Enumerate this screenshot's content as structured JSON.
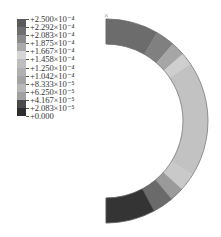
{
  "chart_data": {
    "type": "heatmap",
    "title": "",
    "legend": {
      "position": "top-left",
      "levels": [
        "+2.500×10⁻⁴",
        "+2.292×10⁻⁴",
        "+2.083×10⁻⁴",
        "+1.875×10⁻⁴",
        "+1.667×10⁻⁴",
        "+1.458×10⁻⁴",
        "+1.250×10⁻⁴",
        "+1.042×10⁻⁴",
        "+8.333×10⁻⁵",
        "+6.250×10⁻⁵",
        "+4.167×10⁻⁵",
        "+2.083×10⁻⁵",
        "+0.000"
      ],
      "values": [
        0.00025,
        0.0002292,
        0.0002083,
        0.0001875,
        0.0001667,
        0.0001458,
        0.000125,
        0.0001042,
        8.333e-05,
        6.25e-05,
        4.167e-05,
        2.083e-05,
        0.0
      ],
      "band_colors": [
        "#5a5a5a",
        "#6e6e6e",
        "#8a8a8a",
        "#a9a9a9",
        "#d6d6d6",
        "#bdbdbd",
        "#b0b0b0",
        "#a4a4a4",
        "#b8b8b8",
        "#a0a0a0",
        "#4a4a4a",
        "#2e2e2e"
      ]
    },
    "ring": {
      "center": [
        106,
        121
      ],
      "outer_radius": 102,
      "inner_radius": 77,
      "start_angle_deg": -90,
      "end_angle_deg": 90,
      "bands": [
        {
          "from": -90,
          "to": -60,
          "color": "#6c6c6c"
        },
        {
          "from": -60,
          "to": -49,
          "color": "#808080"
        },
        {
          "from": -49,
          "to": -41,
          "color": "#a6a6a6"
        },
        {
          "from": -41,
          "to": -34,
          "color": "#cfcfcf"
        },
        {
          "from": -34,
          "to": 32,
          "color": "#c2c2c2"
        },
        {
          "from": 32,
          "to": 42,
          "color": "#c9c9c9"
        },
        {
          "from": 42,
          "to": 50,
          "color": "#9a9a9a"
        },
        {
          "from": 50,
          "to": 62,
          "color": "#6a6a6a"
        },
        {
          "from": 62,
          "to": 90,
          "color": "#343434"
        }
      ]
    },
    "marker": {
      "label": "×",
      "position": [
        104,
        18
      ]
    },
    "xlabel": "",
    "ylabel": "",
    "grid": false
  }
}
